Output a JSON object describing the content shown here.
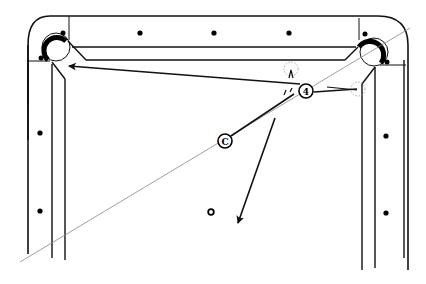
{
  "diagram": {
    "colors": {
      "ink": "#111111",
      "aim_line": "#888888",
      "ghost_ball": "#999999",
      "background": "#ffffff"
    },
    "balls": [
      {
        "id": "cue",
        "label": "C"
      },
      {
        "id": "object",
        "label": "4"
      }
    ],
    "pockets": [
      "top-left-corner-pocket",
      "top-right-corner-pocket"
    ],
    "paths": [
      "object-ball-to-left-pocket",
      "cue-ball-to-object",
      "cue-ball-deflection",
      "object-ball-rebound"
    ],
    "diamonds": {
      "top_rail": 4,
      "left_rail": 2,
      "right_rail": 2
    }
  }
}
